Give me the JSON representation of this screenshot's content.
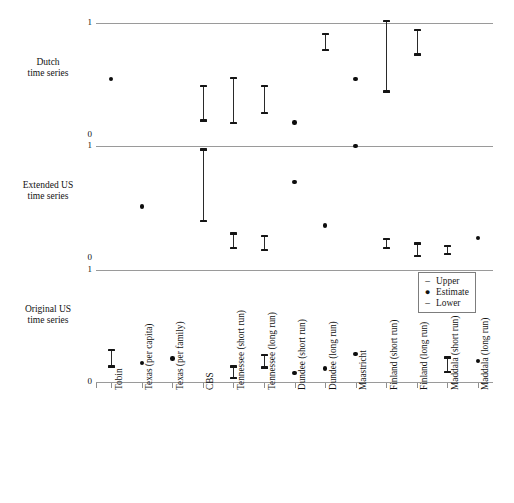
{
  "chart_data": {
    "type": "scatter",
    "title": "",
    "xlabel": "",
    "ylabel": "",
    "ylim": [
      0,
      1
    ],
    "yticks": [
      "0",
      "1"
    ],
    "grid": false,
    "legend_position": "middle-right",
    "legend": [
      {
        "mark": "–",
        "label": "Upper"
      },
      {
        "mark": "●",
        "label": "Estimate"
      },
      {
        "mark": "–",
        "label": "Lower"
      }
    ],
    "categories": [
      "Tobin",
      "Texas (per capita)",
      "Texas (per family)",
      "CBS",
      "Tennessee (short run)",
      "Tennessee (long run)",
      "Dundee (short run)",
      "Dundee (long run)",
      "Maastricht",
      "Finland (short run)",
      "Finland (long run)",
      "Maddala (short run)",
      "Maddala (long run)"
    ],
    "panels": [
      {
        "name": "Dutch time series",
        "label_lines": [
          "Dutch",
          "time series"
        ],
        "ytop_label": "1",
        "ybottom_label": "0",
        "points": [
          {
            "category": "Tobin",
            "estimate": 0.5,
            "upper": null,
            "lower": null
          },
          {
            "category": "Texas (per capita)",
            "estimate": null,
            "upper": null,
            "lower": null
          },
          {
            "category": "Texas (per family)",
            "estimate": null,
            "upper": null,
            "lower": null
          },
          {
            "category": "CBS",
            "estimate": null,
            "upper": 0.44,
            "lower": 0.13
          },
          {
            "category": "Tennessee (short run)",
            "estimate": null,
            "upper": 0.51,
            "lower": 0.11
          },
          {
            "category": "Tennessee (long run)",
            "estimate": null,
            "upper": 0.44,
            "lower": 0.2
          },
          {
            "category": "Dundee (short run)",
            "estimate": 0.11,
            "upper": null,
            "lower": null
          },
          {
            "category": "Dundee (long run)",
            "estimate": null,
            "upper": 0.9,
            "lower": 0.76
          },
          {
            "category": "Maastricht",
            "estimate": 0.5,
            "upper": null,
            "lower": null
          },
          {
            "category": "Finland (short run)",
            "estimate": null,
            "upper": 1.02,
            "lower": 0.39
          },
          {
            "category": "Finland (long run)",
            "estimate": null,
            "upper": 0.94,
            "lower": 0.72
          },
          {
            "category": "Maddala (short run)",
            "estimate": null,
            "upper": null,
            "lower": null
          },
          {
            "category": "Maddala (long run)",
            "estimate": null,
            "upper": null,
            "lower": null
          }
        ]
      },
      {
        "name": "Extended US time series",
        "label_lines": [
          "Extended US",
          "time series"
        ],
        "ytop_label": "1",
        "ybottom_label": "0",
        "points": [
          {
            "category": "Tobin",
            "estimate": null,
            "upper": null,
            "lower": null
          },
          {
            "category": "Texas (per capita)",
            "estimate": 0.46,
            "upper": null,
            "lower": null
          },
          {
            "category": "Texas (per family)",
            "estimate": null,
            "upper": null,
            "lower": null
          },
          {
            "category": "CBS",
            "estimate": null,
            "upper": 0.97,
            "lower": 0.33
          },
          {
            "category": "Tennessee (short run)",
            "estimate": null,
            "upper": 0.22,
            "lower": 0.09
          },
          {
            "category": "Tennessee (long run)",
            "estimate": null,
            "upper": 0.2,
            "lower": 0.07
          },
          {
            "category": "Dundee (short run)",
            "estimate": 0.68,
            "upper": null,
            "lower": null
          },
          {
            "category": "Dundee (long run)",
            "estimate": 0.29,
            "upper": null,
            "lower": null
          },
          {
            "category": "Maastricht",
            "estimate": 1.0,
            "upper": null,
            "lower": null
          },
          {
            "category": "Finland (short run)",
            "estimate": null,
            "upper": 0.17,
            "lower": 0.09
          },
          {
            "category": "Finland (long run)",
            "estimate": null,
            "upper": 0.13,
            "lower": 0.02
          },
          {
            "category": "Maddala (short run)",
            "estimate": null,
            "upper": 0.11,
            "lower": 0.04
          },
          {
            "category": "Maddala (long run)",
            "estimate": 0.18,
            "upper": null,
            "lower": null
          }
        ]
      },
      {
        "name": "Original US time series",
        "label_lines": [
          "Original US",
          "time series"
        ],
        "ytop_label": "1",
        "ybottom_label": "0",
        "points": [
          {
            "category": "Tobin",
            "estimate": null,
            "upper": 0.29,
            "lower": 0.14
          },
          {
            "category": "Texas (per capita)",
            "estimate": 0.17,
            "upper": null,
            "lower": null
          },
          {
            "category": "Texas (per family)",
            "estimate": 0.21,
            "upper": null,
            "lower": null
          },
          {
            "category": "CBS",
            "estimate": null,
            "upper": null,
            "lower": null
          },
          {
            "category": "Tennessee (short run)",
            "estimate": null,
            "upper": 0.14,
            "lower": 0.04
          },
          {
            "category": "Tennessee (long run)",
            "estimate": null,
            "upper": 0.24,
            "lower": 0.13
          },
          {
            "category": "Dundee (short run)",
            "estimate": 0.08,
            "upper": null,
            "lower": null
          },
          {
            "category": "Dundee (long run)",
            "estimate": 0.12,
            "upper": null,
            "lower": null
          },
          {
            "category": "Maastricht",
            "estimate": 0.25,
            "upper": null,
            "lower": null
          },
          {
            "category": "Finland (short run)",
            "estimate": null,
            "upper": null,
            "lower": null
          },
          {
            "category": "Finland (long run)",
            "estimate": null,
            "upper": null,
            "lower": null
          },
          {
            "category": "Maddala (short run)",
            "estimate": null,
            "upper": 0.22,
            "lower": 0.09
          },
          {
            "category": "Maddala (long run)",
            "estimate": 0.19,
            "upper": null,
            "lower": null
          }
        ]
      }
    ]
  }
}
